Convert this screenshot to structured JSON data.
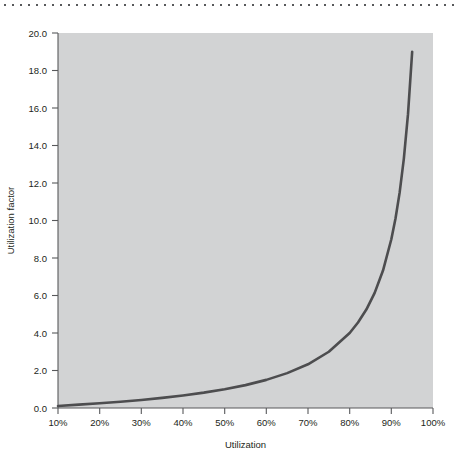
{
  "page": {
    "top_rule": "dotted-rule"
  },
  "chart_data": {
    "type": "line",
    "title": "",
    "xlabel": "Utilization",
    "ylabel": "Utilization factor",
    "xlim": [
      10,
      100
    ],
    "ylim": [
      0.0,
      20.0
    ],
    "grid": false,
    "legend": "none",
    "plot_background_color": "#d2d3d4",
    "line_color": "#4d4d4f",
    "axis_color": "#58595b",
    "x_tick_labels": [
      "10%",
      "20%",
      "30%",
      "40%",
      "50%",
      "60%",
      "70%",
      "80%",
      "90%",
      "100%"
    ],
    "x_tick_values": [
      10,
      20,
      30,
      40,
      50,
      60,
      70,
      80,
      90,
      100
    ],
    "y_tick_labels": [
      "0.0",
      "2.0",
      "4.0",
      "6.0",
      "8.0",
      "10.0",
      "12.0",
      "14.0",
      "16.0",
      "18.0",
      "20.0"
    ],
    "y_tick_values": [
      0.0,
      2.0,
      4.0,
      6.0,
      8.0,
      10.0,
      12.0,
      14.0,
      16.0,
      18.0,
      20.0
    ],
    "series": [
      {
        "name": "Utilization factor",
        "formula": "U / (1 - U)",
        "x": [
          10,
          15,
          20,
          25,
          30,
          35,
          40,
          45,
          50,
          55,
          60,
          65,
          70,
          75,
          80,
          82,
          84,
          86,
          88,
          90,
          91,
          92,
          93,
          94,
          95
        ],
        "values": [
          0.11,
          0.18,
          0.25,
          0.33,
          0.43,
          0.54,
          0.67,
          0.82,
          1.0,
          1.22,
          1.5,
          1.86,
          2.33,
          3.0,
          4.0,
          4.56,
          5.25,
          6.14,
          7.33,
          9.0,
          10.11,
          11.5,
          13.29,
          15.67,
          19.0
        ]
      }
    ]
  }
}
